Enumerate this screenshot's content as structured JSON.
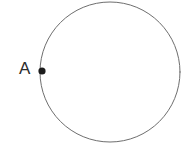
{
  "figure": {
    "kind": "geometry-diagram",
    "caption": "",
    "background_color": "#ffffff",
    "canvas": {
      "width": 196,
      "height": 156
    },
    "shapes": {
      "circle": {
        "name": "circle-outline",
        "center_x": 110,
        "center_y": 72,
        "radius": 70,
        "stroke_color": "#6e6e6e",
        "stroke_width": 1,
        "fill": "none",
        "note_clipped": "top of circle extends above the visible frame"
      },
      "point": {
        "name": "point-A",
        "x": 42,
        "y": 71,
        "radius": 3.6,
        "fill_color": "#1c1c1c",
        "label": "A",
        "label_color": "#2b2b2b",
        "label_x": 19,
        "label_y": 60,
        "label_font_size": 17
      }
    }
  }
}
